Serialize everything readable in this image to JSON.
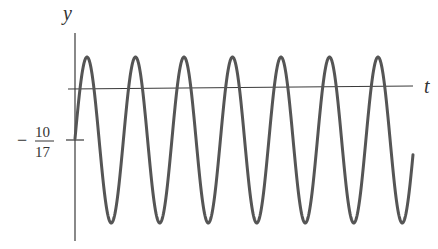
{
  "chart_data": {
    "type": "line",
    "title": "",
    "xlabel": "t",
    "ylabel": "y",
    "y_tick_labels": [
      {
        "value": -0.588,
        "label_sign": "−",
        "numerator": "10",
        "denominator": "17"
      }
    ],
    "x_tick_labels": [],
    "grid": false,
    "legend": null,
    "series": [
      {
        "name": "y(t)",
        "equilibrium": -0.588,
        "amplitude": 0.94,
        "periods_shown": 6.8,
        "peak_y": 0.36,
        "trough_y": -1.53,
        "start_y": -0.51
      }
    ],
    "pixel_geometry": {
      "y_axis_x": 75,
      "y_axis_top": 33,
      "y_axis_bottom": 241,
      "t_axis_x1": 68,
      "t_axis_y1": 89,
      "t_axis_x2": 413,
      "t_axis_y2": 86,
      "tick_y": 140,
      "tick_x1": 66,
      "tick_x2": 84,
      "center_px": 140,
      "amplitude_px": 83,
      "start_x": 75,
      "end_x": 413,
      "period_px": 48.5,
      "first_peak_x": 87
    }
  },
  "labels": {
    "y_axis": "y",
    "t_axis": "t",
    "tick_sign": "−",
    "tick_num": "10",
    "tick_den": "17"
  }
}
